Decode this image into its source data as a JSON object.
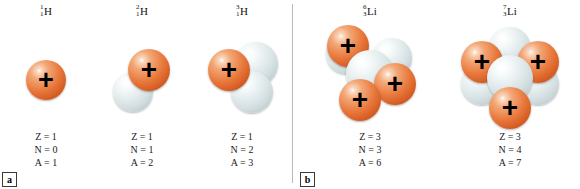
{
  "figure": {
    "panels": [
      {
        "letter": "a",
        "left": 2
      },
      {
        "letter": "b",
        "left": 300
      }
    ],
    "divider_x": 292
  },
  "isotopes": [
    {
      "id": "hydrogen-1",
      "panel": "a",
      "mass_number": "1",
      "atomic_number": "1",
      "element": "H",
      "col_left": 0,
      "col_width": 92,
      "stats": {
        "Z": "Z = 1",
        "N": "N = 0",
        "A": "A = 1"
      },
      "nucleons": [
        {
          "type": "proton",
          "cx": 46,
          "cy": 58,
          "r": 20,
          "z": 2
        }
      ]
    },
    {
      "id": "hydrogen-2",
      "panel": "a",
      "mass_number": "2",
      "atomic_number": "1",
      "element": "H",
      "col_left": 92,
      "col_width": 100,
      "stats": {
        "Z": "Z = 1",
        "N": "N = 1",
        "A": "A = 2"
      },
      "nucleons": [
        {
          "type": "neutron",
          "cx": 41,
          "cy": 70,
          "r": 20,
          "z": 1
        },
        {
          "type": "proton",
          "cx": 57,
          "cy": 48,
          "r": 21,
          "z": 3
        }
      ]
    },
    {
      "id": "hydrogen-3",
      "panel": "a",
      "mass_number": "3",
      "atomic_number": "1",
      "element": "H",
      "col_left": 192,
      "col_width": 100,
      "stats": {
        "Z": "Z = 1",
        "N": "N = 2",
        "A": "A = 3"
      },
      "nucleons": [
        {
          "type": "neutron",
          "cx": 64,
          "cy": 42,
          "r": 22,
          "z": 1
        },
        {
          "type": "neutron",
          "cx": 60,
          "cy": 70,
          "r": 21,
          "z": 2
        },
        {
          "type": "proton",
          "cx": 37,
          "cy": 48,
          "r": 21,
          "z": 3
        }
      ]
    },
    {
      "id": "lithium-6",
      "panel": "b",
      "mass_number": "6",
      "atomic_number": "3",
      "element": "Li",
      "col_left": 300,
      "col_width": 140,
      "stats": {
        "Z": "Z = 3",
        "N": "N = 3",
        "A": "A = 6"
      },
      "nucleons": [
        {
          "type": "neutron",
          "cx": 46,
          "cy": 32,
          "r": 20,
          "z": 1
        },
        {
          "type": "neutron",
          "cx": 92,
          "cy": 36,
          "r": 20,
          "z": 1
        },
        {
          "type": "proton",
          "cx": 48,
          "cy": 24,
          "r": 21,
          "z": 2
        },
        {
          "type": "neutron",
          "cx": 70,
          "cy": 52,
          "r": 24,
          "z": 3
        },
        {
          "type": "proton",
          "cx": 95,
          "cy": 62,
          "r": 21,
          "z": 4
        },
        {
          "type": "proton",
          "cx": 60,
          "cy": 78,
          "r": 21,
          "z": 5
        }
      ]
    },
    {
      "id": "lithium-7",
      "panel": "b",
      "mass_number": "7",
      "atomic_number": "3",
      "element": "Li",
      "col_left": 440,
      "col_width": 140,
      "stats": {
        "Z": "Z = 3",
        "N": "N = 4",
        "A": "A = 7"
      },
      "nucleons": [
        {
          "type": "neutron",
          "cx": 70,
          "cy": 26,
          "r": 21,
          "z": 1
        },
        {
          "type": "neutron",
          "cx": 42,
          "cy": 62,
          "r": 21,
          "z": 1
        },
        {
          "type": "neutron",
          "cx": 98,
          "cy": 62,
          "r": 21,
          "z": 1
        },
        {
          "type": "proton",
          "cx": 42,
          "cy": 40,
          "r": 21,
          "z": 2
        },
        {
          "type": "proton",
          "cx": 98,
          "cy": 40,
          "r": 21,
          "z": 2
        },
        {
          "type": "neutron",
          "cx": 70,
          "cy": 56,
          "r": 23,
          "z": 3
        },
        {
          "type": "proton",
          "cx": 70,
          "cy": 86,
          "r": 21,
          "z": 4
        }
      ]
    }
  ],
  "symbols": {
    "proton_charge": "+"
  },
  "colors": {
    "proton": "#e8783c",
    "neutron": "#e2eaec",
    "text": "#111111",
    "divider": "#b9b9b9"
  }
}
